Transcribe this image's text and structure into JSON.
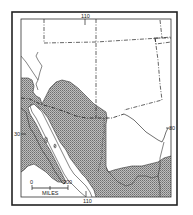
{
  "map": {
    "title": "",
    "region": "Southwestern United States and northwestern Mexico",
    "colors": {
      "background": "#ffffff",
      "ink": "#222222",
      "range_fill": "#a9a9a9"
    },
    "graticule": {
      "longitude_label_top": "110",
      "longitude_label_bottom": "110",
      "latitude_label_left": "30",
      "latitude_label_right": "30"
    },
    "scale_bar": {
      "start_label": "0",
      "end_label": "200",
      "unit_label": "MILES"
    },
    "legend": {
      "shaded_area": "distribution range"
    }
  }
}
